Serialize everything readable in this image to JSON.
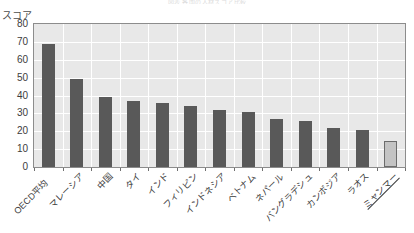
{
  "figure": {
    "faint_top_caption": "図表 各国の人材スコア比較",
    "y_axis_title": "スコア"
  },
  "chart_data": {
    "type": "bar",
    "title": "",
    "xlabel": "",
    "ylabel": "スコア",
    "ylim": [
      0,
      80
    ],
    "yticks": [
      "0",
      "10",
      "20",
      "30",
      "40",
      "50",
      "60",
      "70",
      "80"
    ],
    "grid": true,
    "legend": "none",
    "categories": [
      "OECD平均",
      "マレーシア",
      "中国",
      "タイ",
      "インド",
      "フィリピン",
      "インドネシア",
      "ベトナム",
      "ネパール",
      "バングラデシュ",
      "カンボジア",
      "ラオス",
      "ミャンマー"
    ],
    "values": [
      69,
      49,
      39,
      37,
      36,
      34,
      32,
      31,
      27,
      26,
      22,
      21,
      14.5
    ],
    "highlight_index": 12,
    "colors": {
      "bar": "#595959",
      "bar_highlight": "#c3c3c3",
      "bar_highlight_border": "#6b6b6b",
      "plot_background": "#e8e8e8",
      "gridline": "#ffffff",
      "axis_border": "#8c8c8c",
      "tick_text": "#3c3c3c"
    }
  }
}
